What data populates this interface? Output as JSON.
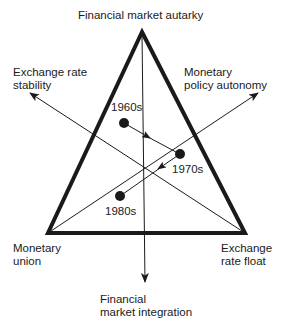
{
  "diagram": {
    "type": "triangle-trilemma",
    "colors": {
      "ink": "#1a1a1a",
      "background": "#ffffff"
    },
    "vertices": {
      "top": {
        "line1": "Financial market autarky"
      },
      "bottom_left": {
        "line1": "Monetary",
        "line2": "union"
      },
      "bottom_right": {
        "line1": "Exchange",
        "line2": "rate float"
      }
    },
    "axes": {
      "upper_left": {
        "line1": "Exchange rate",
        "line2": "stability"
      },
      "upper_right": {
        "line1": "Monetary",
        "line2": "policy autonomy"
      },
      "bottom": {
        "line1": "Financial",
        "line2": "market integration"
      }
    },
    "points": [
      {
        "label": "1960s"
      },
      {
        "label": "1970s"
      },
      {
        "label": "1980s"
      }
    ],
    "path_order": [
      "1960s",
      "1970s",
      "1980s"
    ]
  }
}
